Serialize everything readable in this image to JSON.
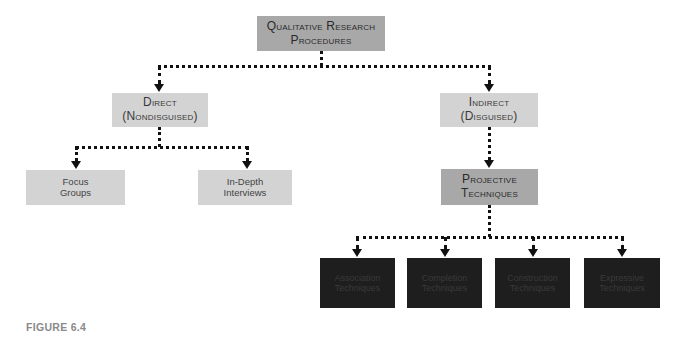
{
  "diagram": {
    "root": {
      "line1": "Qualitative Research",
      "line2": "Procedures"
    },
    "level1": [
      {
        "line1": "Direct",
        "line2": "(Nondisguised)"
      },
      {
        "line1": "Indirect",
        "line2": "(Disguised)"
      }
    ],
    "direct_children": [
      {
        "line1": "Focus",
        "line2": "Groups"
      },
      {
        "line1": "In-Depth",
        "line2": "Interviews"
      }
    ],
    "indirect_child": {
      "line1": "Projective",
      "line2": "Techniques"
    },
    "projective_children": [
      {
        "line1": "Association",
        "line2": "Techniques"
      },
      {
        "line1": "Completion",
        "line2": "Techniques"
      },
      {
        "line1": "Construction",
        "line2": "Techniques"
      },
      {
        "line1": "Expressive",
        "line2": "Techniques"
      }
    ],
    "colors": {
      "light_box": "#d3d3d3",
      "mid_box": "#a8a8a8",
      "dark_box": "#1e1e1e",
      "connector": "#111111",
      "caption": "#8a8a8a"
    }
  },
  "caption": "FIGURE 6.4"
}
